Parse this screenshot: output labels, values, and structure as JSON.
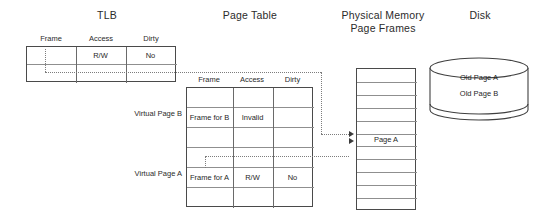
{
  "figure": {
    "titles": {
      "tlb": "TLB",
      "page_table": "Page Table",
      "physical_memory_line1": "Physical Memory",
      "physical_memory_line2": "Page Frames",
      "disk": "Disk"
    }
  },
  "tlb": {
    "columns": [
      "Frame",
      "Access",
      "Dirty"
    ],
    "rows": [
      {
        "frame": "",
        "access": "R/W",
        "dirty": "No"
      },
      {
        "frame": "",
        "access": "",
        "dirty": ""
      }
    ]
  },
  "page_table": {
    "columns": [
      "Frame",
      "Access",
      "Dirty"
    ],
    "row_labels": {
      "virtual_page_b": "Virtual Page B",
      "virtual_page_a": "Virtual Page A"
    },
    "rows": [
      {
        "label": "",
        "frame": "",
        "access": "",
        "dirty": ""
      },
      {
        "label": "Virtual Page B",
        "frame": "Frame for B",
        "access": "Invalid",
        "dirty": ""
      },
      {
        "label": "",
        "frame": "",
        "access": "",
        "dirty": ""
      },
      {
        "label": "",
        "frame": "",
        "access": "",
        "dirty": ""
      },
      {
        "label": "Virtual Page A",
        "frame": "Frame for A",
        "access": "R/W",
        "dirty": "No"
      },
      {
        "label": "",
        "frame": "",
        "access": "",
        "dirty": ""
      }
    ]
  },
  "physical_memory": {
    "frames": [
      "",
      "",
      "",
      "",
      "",
      "Page A",
      "",
      "",
      "",
      "",
      ""
    ],
    "highlighted_frame_index": 5,
    "highlighted_frame_label": "Page A"
  },
  "disk": {
    "contents": [
      "Old Page A",
      "Old Page B"
    ]
  },
  "colors": {
    "stroke": "#4a4a4a",
    "inner_line": "#8f8f8f",
    "dotted": "#7d7d7d",
    "text": "#1f1f1f",
    "background": "#ffffff"
  }
}
